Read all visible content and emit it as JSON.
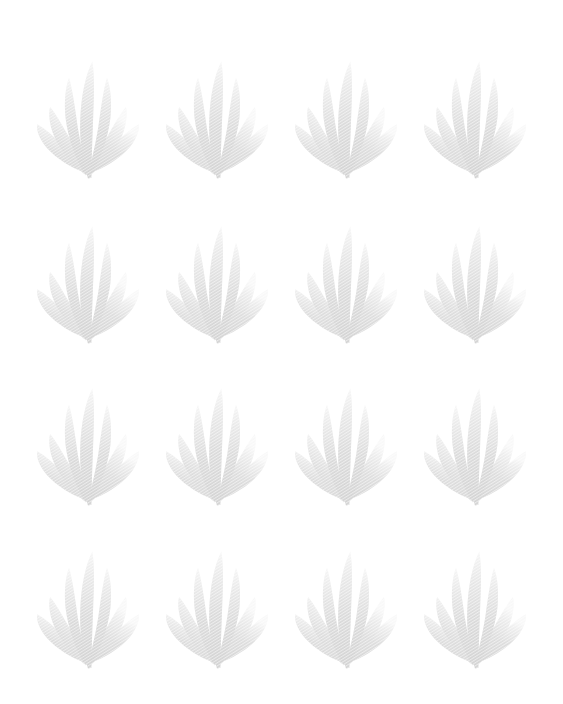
{
  "page": {
    "title": "Decorative Watermark Background",
    "kind": "seamless-motif-pattern",
    "width": 563,
    "height": 704,
    "background_color": "#ffffff"
  },
  "pattern": {
    "motif_name": "stylized-plant-flame-sprig",
    "description": "Pale grey stylized plant sprig with seven tapering blades radiating from a common base",
    "columns": 4,
    "rows": 4,
    "total_motifs": 16,
    "column_centers_px": [
      88,
      217,
      346,
      475
    ],
    "row_centers_px": [
      120,
      285,
      447,
      610
    ],
    "column_spacing_px": 129,
    "row_spacing_px": 163,
    "motif_width_px": 112,
    "motif_height_px": 140,
    "fill_color": "#d7d7d7",
    "fill_color_light": "#e6e6e6",
    "fill_color_tip": "#f0f0f0",
    "hatch_color": "#ffffff",
    "hatch_opacity": "0.55",
    "blade_count": 7,
    "blades": [
      {
        "id": "center-blade",
        "side": "center",
        "lean": 0,
        "height_ratio": 1.0
      },
      {
        "id": "inner-left-blade",
        "side": "left",
        "lean": -1,
        "height_ratio": 0.86
      },
      {
        "id": "inner-right-blade",
        "side": "right",
        "lean": 1,
        "height_ratio": 0.86
      },
      {
        "id": "mid-left-blade",
        "side": "left",
        "lean": -2,
        "height_ratio": 0.62
      },
      {
        "id": "mid-right-blade",
        "side": "right",
        "lean": 2,
        "height_ratio": 0.62
      },
      {
        "id": "outer-left-blade",
        "side": "left",
        "lean": -3,
        "height_ratio": 0.4
      },
      {
        "id": "outer-right-blade",
        "side": "right",
        "lean": 3,
        "height_ratio": 0.4
      }
    ],
    "cells": [
      {
        "row": 0,
        "col": 0,
        "x": 88,
        "y": 120
      },
      {
        "row": 0,
        "col": 1,
        "x": 217,
        "y": 120
      },
      {
        "row": 0,
        "col": 2,
        "x": 346,
        "y": 120
      },
      {
        "row": 0,
        "col": 3,
        "x": 475,
        "y": 120
      },
      {
        "row": 1,
        "col": 0,
        "x": 88,
        "y": 285
      },
      {
        "row": 1,
        "col": 1,
        "x": 217,
        "y": 285
      },
      {
        "row": 1,
        "col": 2,
        "x": 346,
        "y": 285
      },
      {
        "row": 1,
        "col": 3,
        "x": 475,
        "y": 285
      },
      {
        "row": 2,
        "col": 0,
        "x": 88,
        "y": 447
      },
      {
        "row": 2,
        "col": 1,
        "x": 217,
        "y": 447
      },
      {
        "row": 2,
        "col": 2,
        "x": 346,
        "y": 447
      },
      {
        "row": 2,
        "col": 3,
        "x": 475,
        "y": 447
      },
      {
        "row": 3,
        "col": 0,
        "x": 88,
        "y": 610
      },
      {
        "row": 3,
        "col": 1,
        "x": 217,
        "y": 610
      },
      {
        "row": 3,
        "col": 2,
        "x": 346,
        "y": 610
      },
      {
        "row": 3,
        "col": 3,
        "x": 475,
        "y": 610
      }
    ]
  }
}
